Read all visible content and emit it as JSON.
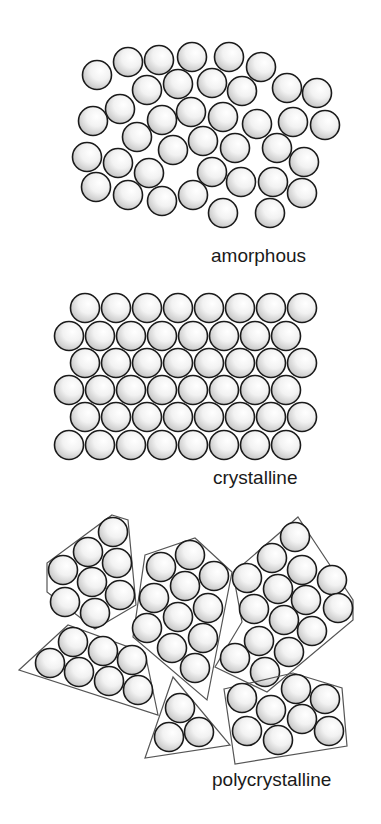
{
  "style": {
    "circle_radius": 14.5,
    "stroke_color": "#1a1a1a",
    "grain_stroke_color": "#555555",
    "fill_highlight": "#ffffff",
    "fill_shadow": "#bdbdbd"
  },
  "panels": [
    {
      "id": "amorphous",
      "label": "amorphous",
      "label_pos": [
        211,
        262
      ],
      "circles": [
        [
          97,
          75
        ],
        [
          128,
          62
        ],
        [
          159,
          60
        ],
        [
          192,
          57
        ],
        [
          229,
          57
        ],
        [
          261,
          67
        ],
        [
          147,
          90
        ],
        [
          178,
          84
        ],
        [
          212,
          83
        ],
        [
          242,
          91
        ],
        [
          287,
          88
        ],
        [
          317,
          93
        ],
        [
          93,
          121
        ],
        [
          120,
          109
        ],
        [
          162,
          120
        ],
        [
          191,
          112
        ],
        [
          223,
          117
        ],
        [
          257,
          124
        ],
        [
          293,
          122
        ],
        [
          325,
          125
        ],
        [
          137,
          137
        ],
        [
          173,
          150
        ],
        [
          203,
          141
        ],
        [
          235,
          148
        ],
        [
          277,
          148
        ],
        [
          87,
          157
        ],
        [
          118,
          163
        ],
        [
          149,
          173
        ],
        [
          212,
          172
        ],
        [
          304,
          162
        ],
        [
          96,
          187
        ],
        [
          128,
          195
        ],
        [
          162,
          201
        ],
        [
          193,
          195
        ],
        [
          241,
          182
        ],
        [
          273,
          182
        ],
        [
          302,
          193
        ],
        [
          223,
          213
        ],
        [
          270,
          213
        ]
      ]
    },
    {
      "id": "crystalline",
      "label": "crystalline",
      "label_pos": [
        213,
        484
      ],
      "grid": {
        "rows": 6,
        "cols": 8,
        "odd_row_x0": 85,
        "even_row_x0": 69,
        "dx": 31,
        "row_y": [
          308,
          336,
          363,
          390,
          417,
          445
        ]
      }
    },
    {
      "id": "polycrystalline",
      "label": "polycrystalline",
      "label_pos": [
        212,
        786
      ],
      "grains": [
        {
          "polygon": [
            [
              112,
              515
            ],
            [
              128,
              520
            ],
            [
              136,
              605
            ],
            [
              95,
              629
            ],
            [
              47,
              592
            ],
            [
              47,
              563
            ]
          ],
          "circles": [
            [
              113,
              532
            ],
            [
              88,
              552
            ],
            [
              117,
              563
            ],
            [
              63,
              570
            ],
            [
              92,
              582
            ],
            [
              65,
              602
            ],
            [
              120,
              595
            ],
            [
              95,
              613
            ]
          ]
        },
        {
          "polygon": [
            [
              145,
              555
            ],
            [
              195,
              538
            ],
            [
              232,
              572
            ],
            [
              207,
              700
            ],
            [
              133,
              637
            ]
          ],
          "circles": [
            [
              190,
              555
            ],
            [
              161,
              567
            ],
            [
              214,
              576
            ],
            [
              185,
              586
            ],
            [
              154,
              598
            ],
            [
              208,
              608
            ],
            [
              178,
              617
            ],
            [
              147,
              628
            ],
            [
              203,
              638
            ],
            [
              172,
              648
            ],
            [
              195,
              668
            ]
          ]
        },
        {
          "polygon": [
            [
              298,
              517
            ],
            [
              353,
              600
            ],
            [
              353,
              620
            ],
            [
              267,
              692
            ],
            [
              215,
              667
            ],
            [
              242,
              622
            ],
            [
              233,
              573
            ]
          ],
          "circles": [
            [
              295,
              537
            ],
            [
              272,
              558
            ],
            [
              302,
              570
            ],
            [
              247,
              578
            ],
            [
              332,
              580
            ],
            [
              278,
              589
            ],
            [
              306,
              600
            ],
            [
              254,
              609
            ],
            [
              338,
              608
            ],
            [
              284,
              620
            ],
            [
              312,
              631
            ],
            [
              259,
              641
            ],
            [
              289,
              652
            ],
            [
              235,
              658
            ],
            [
              265,
              672
            ]
          ]
        },
        {
          "polygon": [
            [
              19,
              670
            ],
            [
              68,
              625
            ],
            [
              145,
              653
            ],
            [
              158,
              715
            ]
          ],
          "circles": [
            [
              73,
              642
            ],
            [
              50,
              663
            ],
            [
              103,
              651
            ],
            [
              79,
              672
            ],
            [
              132,
              660
            ],
            [
              109,
              681
            ],
            [
              138,
              690
            ]
          ]
        },
        {
          "polygon": [
            [
              173,
              677
            ],
            [
              230,
              745
            ],
            [
              145,
              758
            ]
          ],
          "circles": [
            [
              180,
              708
            ],
            [
              169,
              737
            ],
            [
              199,
              732
            ]
          ]
        },
        {
          "polygon": [
            [
              224,
              689
            ],
            [
              293,
              673
            ],
            [
              342,
              688
            ],
            [
              347,
              746
            ],
            [
              235,
              764
            ]
          ],
          "circles": [
            [
              242,
              698
            ],
            [
              296,
              689
            ],
            [
              325,
              699
            ],
            [
              271,
              710
            ],
            [
              302,
              719
            ],
            [
              247,
              731
            ],
            [
              329,
              731
            ],
            [
              278,
              740
            ]
          ]
        }
      ]
    }
  ]
}
